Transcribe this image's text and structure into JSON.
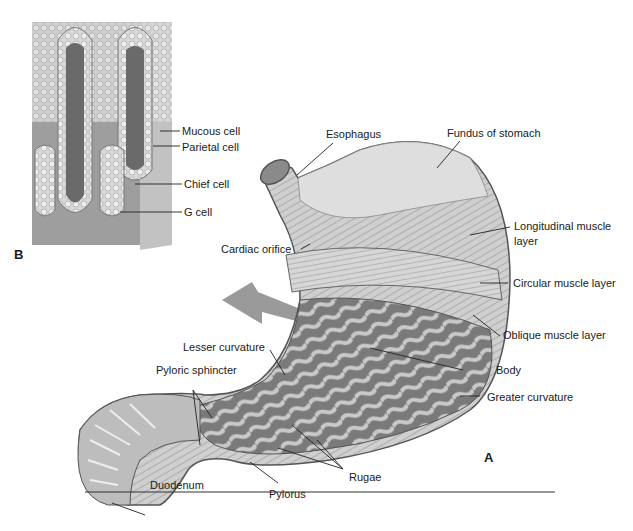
{
  "figure": {
    "panels": {
      "a": {
        "letter": "A",
        "title": "Stomach anatomy"
      },
      "b": {
        "letter": "B",
        "title": "Gastric gland cross-section"
      }
    },
    "labels_b": {
      "mucous_cell": "Mucous cell",
      "parietal_cell": "Parietal cell",
      "chief_cell": "Chief cell",
      "g_cell": "G cell"
    },
    "labels_a": {
      "esophagus": "Esophagus",
      "fundus": "Fundus of stomach",
      "longitudinal_line1": "Longitudinal muscle",
      "longitudinal_line2": "layer",
      "cardiac_orifice": "Cardiac orifice",
      "circular": "Circular muscle layer",
      "oblique": "Oblique muscle layer",
      "lesser_curvature": "Lesser curvature",
      "body": "Body",
      "pyloric_sphincter": "Pyloric sphincter",
      "greater_curvature": "Greater curvature",
      "rugae": "Rugae",
      "duodenum": "Duodenum",
      "pylorus": "Pylorus"
    },
    "colors": {
      "tissue_light": "#d9d9d9",
      "tissue_mid": "#a8a8a8",
      "tissue_dark": "#6e6e6e",
      "arrow": "#9a9a9a",
      "line": "#222222"
    }
  }
}
